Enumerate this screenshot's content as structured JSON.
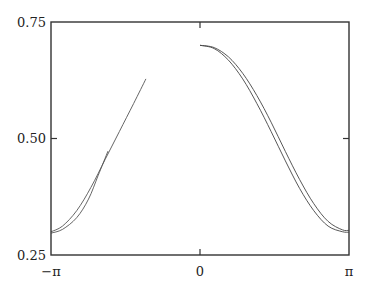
{
  "chart_data": {
    "type": "line",
    "title": "",
    "xlabel": "",
    "ylabel": "",
    "xlim": [
      -3.14159,
      3.14159
    ],
    "ylim": [
      0.25,
      0.75
    ],
    "grid": false,
    "legend": null,
    "x_ticks": [
      {
        "value": -3.14159,
        "label": "−π"
      },
      {
        "value": 0,
        "label": "0"
      },
      {
        "value": 3.14159,
        "label": "π"
      }
    ],
    "y_ticks": [
      {
        "value": 0.25,
        "label": "0.25"
      },
      {
        "value": 0.5,
        "label": "0.50"
      },
      {
        "value": 0.75,
        "label": "0.75"
      }
    ],
    "series": [
      {
        "name": "curve-a-left",
        "color": "#555555",
        "x": [
          -3.14,
          -2.9,
          -2.6,
          -2.3,
          -2.0,
          -1.7,
          -1.4,
          -1.14
        ],
        "y": [
          0.3,
          0.312,
          0.345,
          0.395,
          0.455,
          0.515,
          0.575,
          0.628
        ]
      },
      {
        "name": "curve-b-left",
        "color": "#555555",
        "x": [
          -3.14,
          -2.9,
          -2.6,
          -2.35,
          -2.15,
          -1.94
        ],
        "y": [
          0.297,
          0.305,
          0.33,
          0.37,
          0.42,
          0.473
        ]
      },
      {
        "name": "curve-a-right",
        "color": "#444444",
        "x": [
          0,
          0.3,
          0.6,
          0.9,
          1.2,
          1.5,
          1.8,
          2.1,
          2.4,
          2.7,
          3.0,
          3.14
        ],
        "y": [
          0.7,
          0.693,
          0.668,
          0.628,
          0.575,
          0.515,
          0.452,
          0.393,
          0.345,
          0.312,
          0.3,
          0.299
        ]
      },
      {
        "name": "curve-b-right",
        "color": "#444444",
        "x": [
          0,
          0.3,
          0.6,
          0.9,
          1.2,
          1.5,
          1.8,
          2.1,
          2.4,
          2.7,
          3.0,
          3.14
        ],
        "y": [
          0.7,
          0.695,
          0.675,
          0.64,
          0.592,
          0.535,
          0.472,
          0.412,
          0.36,
          0.322,
          0.304,
          0.303
        ]
      }
    ]
  },
  "axes": {
    "y_labels": [
      "0.75",
      "0.50",
      "0.25"
    ],
    "x_labels": [
      "−π",
      "0",
      "π"
    ]
  }
}
